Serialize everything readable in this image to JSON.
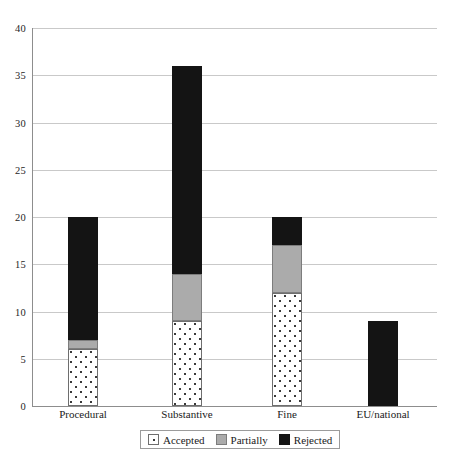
{
  "chart_data": {
    "type": "bar",
    "stacked": true,
    "title": "",
    "subtitle": "",
    "xlabel": "",
    "ylabel": "",
    "ylim": [
      0,
      40
    ],
    "yticks": [
      0,
      5,
      10,
      15,
      20,
      25,
      30,
      35,
      40
    ],
    "ytick_labels": [
      "0",
      "5",
      "10",
      "15",
      "20",
      "25",
      "30",
      "35",
      "40"
    ],
    "grid": "horizontal",
    "legend_position": "bottom",
    "categories": [
      "Procedural",
      "Substantive",
      "Fine",
      "EU/national"
    ],
    "series": [
      {
        "name": "Accepted",
        "values": [
          6,
          9,
          12,
          0
        ],
        "color": "#ffffff",
        "pattern": "dots"
      },
      {
        "name": "Partially",
        "values": [
          1,
          5,
          5,
          0
        ],
        "color": "#ababab",
        "pattern": "solid"
      },
      {
        "name": "Rejected",
        "values": [
          13,
          22,
          3,
          9
        ],
        "color": "#141414",
        "pattern": "solid"
      }
    ],
    "totals": [
      20,
      36,
      20,
      9
    ]
  },
  "legend": {
    "items": [
      {
        "label": "Accepted",
        "swatch": "accepted-swatch"
      },
      {
        "label": "Partially",
        "swatch": "partially-swatch"
      },
      {
        "label": "Rejected",
        "swatch": "rejected-swatch"
      }
    ]
  }
}
